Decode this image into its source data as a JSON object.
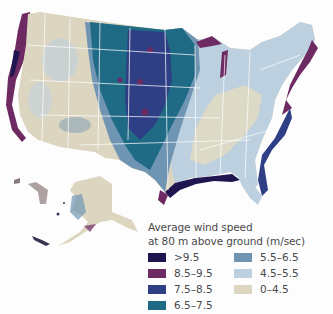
{
  "map": {
    "subject": "Contiguous United States and Alaska wind resource map",
    "colors": {
      "gt_9_5": "#1f1650",
      "8_5_9_5": "#6e2a63",
      "7_5_8_5": "#2e3f86",
      "6_5_7_5": "#1f6b85",
      "5_5_6_5": "#6f95b3",
      "4_5_5_5": "#bcd0df",
      "0_4_5": "#dcd6c0",
      "state_lines": "#ffffff",
      "background": "#fdfdfd"
    }
  },
  "legend": {
    "title_line1": "Average wind speed",
    "title_line2": "at 80 m above ground (m/sec)",
    "items": [
      {
        "label": ">9.5",
        "color": "#1f1650"
      },
      {
        "label": "8.5–9.5",
        "color": "#6e2a63"
      },
      {
        "label": "7.5–8.5",
        "color": "#2e3f86"
      },
      {
        "label": "6.5–7.5",
        "color": "#1f6b85"
      },
      {
        "label": "5.5–6.5",
        "color": "#6f95b3"
      },
      {
        "label": "4.5–5.5",
        "color": "#bcd0df"
      },
      {
        "label": "0–4.5",
        "color": "#dcd6c0"
      }
    ]
  }
}
